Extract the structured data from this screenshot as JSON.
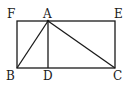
{
  "diagram": {
    "type": "geometry",
    "stroke_color": "#1a1a1a",
    "points": {
      "F": {
        "label": "F",
        "x": 17,
        "y": 21
      },
      "A": {
        "label": "A",
        "x": 48,
        "y": 21
      },
      "E": {
        "label": "E",
        "x": 115,
        "y": 21
      },
      "B": {
        "label": "B",
        "x": 17,
        "y": 68
      },
      "D": {
        "label": "D",
        "x": 48,
        "y": 68
      },
      "C": {
        "label": "C",
        "x": 115,
        "y": 68
      }
    },
    "segments": [
      [
        "F",
        "E"
      ],
      [
        "E",
        "C"
      ],
      [
        "C",
        "B"
      ],
      [
        "B",
        "F"
      ],
      [
        "A",
        "B"
      ],
      [
        "A",
        "D"
      ],
      [
        "A",
        "C"
      ]
    ]
  }
}
